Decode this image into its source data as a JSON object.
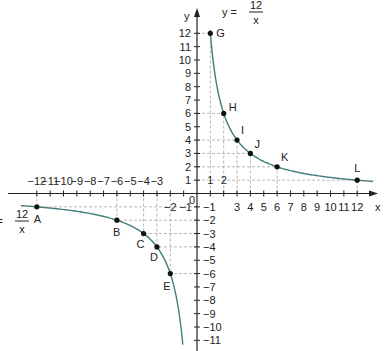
{
  "chart_data": {
    "type": "line",
    "title": "",
    "xlabel": "x",
    "ylabel": "y",
    "xlim": [
      -12,
      12
    ],
    "ylim": [
      -11,
      12
    ],
    "grid": "dashed guides to labeled points",
    "equation_labels": [
      "y = 12/x",
      "y = 12/x"
    ],
    "series": [
      {
        "name": "y = 12/x (x>0)",
        "color": "#3f7f7a",
        "points": [
          {
            "label": "G",
            "x": 1,
            "y": 12
          },
          {
            "label": "H",
            "x": 2,
            "y": 6
          },
          {
            "label": "I",
            "x": 3,
            "y": 4
          },
          {
            "label": "J",
            "x": 4,
            "y": 3
          },
          {
            "label": "K",
            "x": 6,
            "y": 2
          },
          {
            "label": "L",
            "x": 12,
            "y": 1
          }
        ]
      },
      {
        "name": "y = 12/x (x<0)",
        "color": "#3f7f7a",
        "points": [
          {
            "label": "A",
            "x": -12,
            "y": -1
          },
          {
            "label": "B",
            "x": -6,
            "y": -2
          },
          {
            "label": "C",
            "x": -4,
            "y": -3
          },
          {
            "label": "D",
            "x": -3,
            "y": -4
          },
          {
            "label": "E",
            "x": -2,
            "y": -6
          }
        ]
      }
    ]
  },
  "labels": {
    "x_axis": "x",
    "y_axis": "y",
    "origin": "0",
    "eq_num": "12",
    "eq_den": "x",
    "eq_lhs": "y =",
    "eq_lhs_left": "y ="
  }
}
